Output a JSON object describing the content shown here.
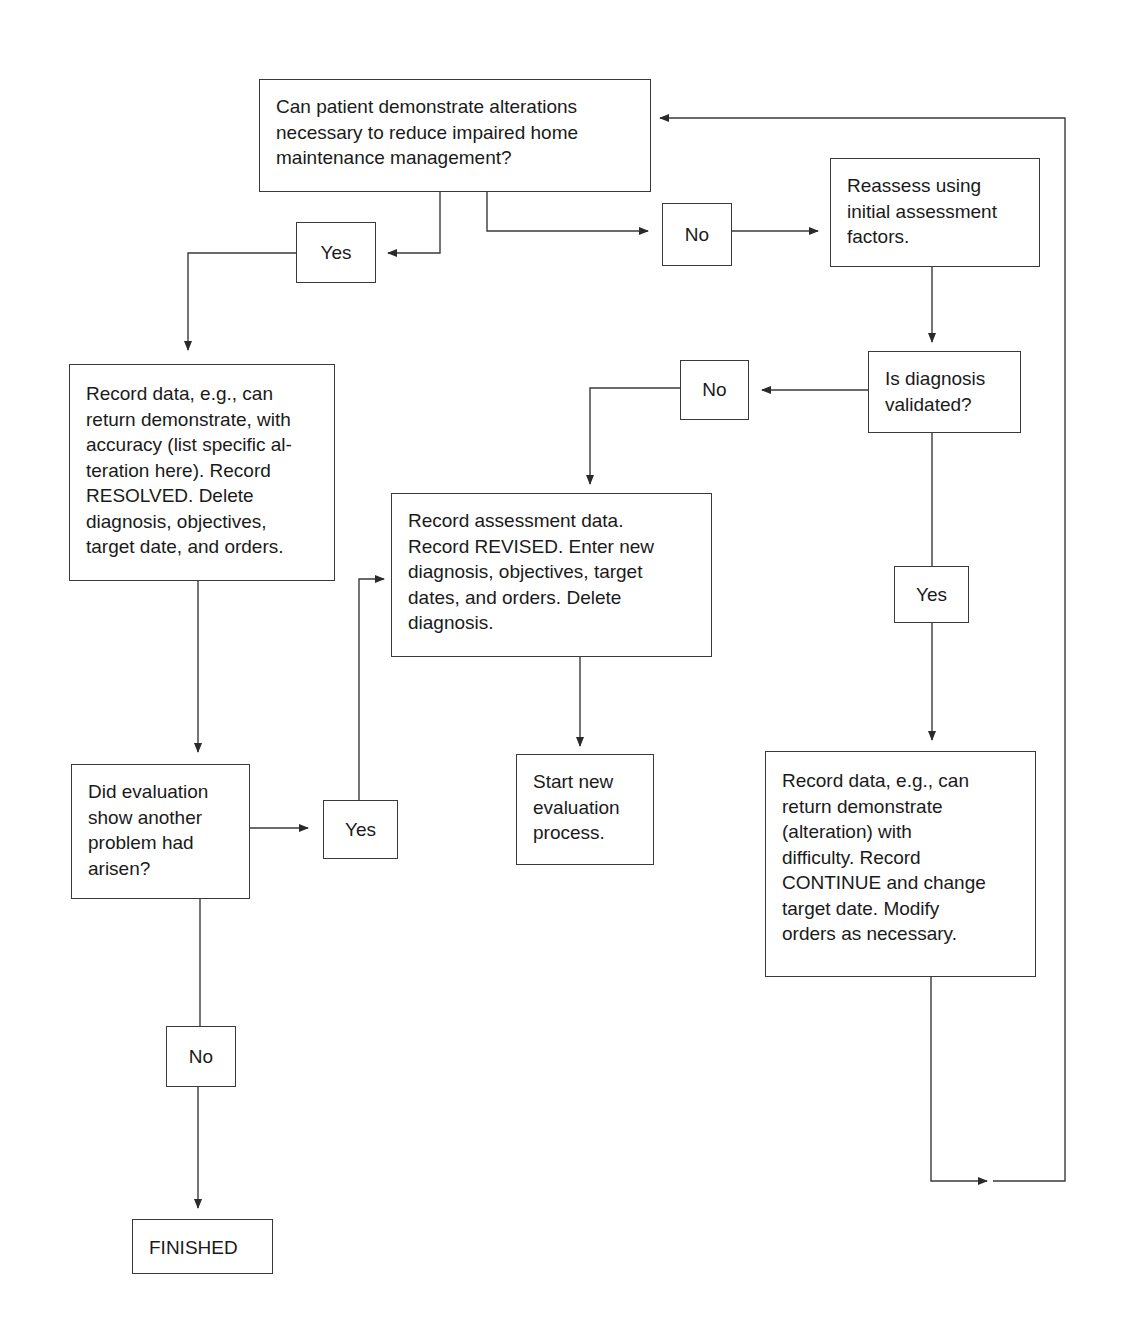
{
  "diagram": {
    "nodes": {
      "start_question": "Can patient demonstrate alterations\nnecessary to reduce impaired home\nmaintenance management?",
      "yes_1": "Yes",
      "no_1": "No",
      "reassess": "Reassess using\ninitial assessment\nfactors.",
      "resolved_record": "Record data, e.g., can\nreturn demonstrate, with\naccuracy (list specific al-\nteration here). Record\nRESOLVED. Delete\ndiagnosis, objectives,\ntarget date, and orders.",
      "no_2": "No",
      "diagnosis_validated": "Is diagnosis\nvalidated?",
      "revised_record": "Record assessment data.\nRecord REVISED. Enter new\ndiagnosis, objectives, target\ndates, and orders. Delete\ndiagnosis.",
      "yes_2": "Yes",
      "evaluation_question": "Did evaluation\nshow another\nproblem had\narisen?",
      "yes_3": "Yes",
      "start_new_evaluation": "Start new\nevaluation\nprocess.",
      "continue_record": "Record data, e.g., can\nreturn demonstrate\n(alteration) with\ndifficulty. Record\nCONTINUE and change\ntarget date. Modify\norders as necessary.",
      "no_3": "No",
      "finished": "FINISHED"
    },
    "edges": [
      {
        "from": "start_question",
        "to": "yes_1"
      },
      {
        "from": "start_question",
        "to": "no_1"
      },
      {
        "from": "no_1",
        "to": "reassess"
      },
      {
        "from": "yes_1",
        "to": "resolved_record"
      },
      {
        "from": "reassess",
        "to": "diagnosis_validated"
      },
      {
        "from": "diagnosis_validated",
        "to": "no_2"
      },
      {
        "from": "no_2",
        "to": "revised_record"
      },
      {
        "from": "diagnosis_validated",
        "to": "yes_2"
      },
      {
        "from": "yes_2",
        "to": "continue_record"
      },
      {
        "from": "resolved_record",
        "to": "evaluation_question"
      },
      {
        "from": "evaluation_question",
        "to": "yes_3"
      },
      {
        "from": "yes_3",
        "to": "revised_record"
      },
      {
        "from": "revised_record",
        "to": "start_new_evaluation"
      },
      {
        "from": "evaluation_question",
        "to": "no_3"
      },
      {
        "from": "no_3",
        "to": "finished"
      },
      {
        "from": "continue_record",
        "to": "start_question"
      }
    ]
  }
}
